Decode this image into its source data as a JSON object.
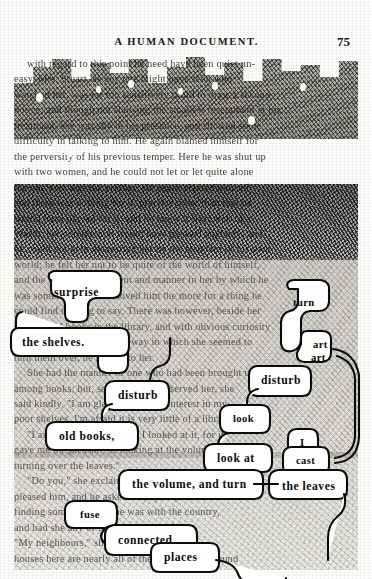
{
  "page": {
    "running_head": "A HUMAN DOCUMENT.",
    "folio": "75",
    "artwork_style": "treated-page",
    "colors": {
      "paper": "#fdfdfc",
      "ink": "#171715",
      "river": "#ffffff",
      "river_outline": "#0c0c0b",
      "wash_dark": "#1e1b17",
      "wash_mid": "#8a8377"
    }
  },
  "river_words": [
    {
      "id": "surprise",
      "text": "surprise",
      "x": 54,
      "y": 286
    },
    {
      "id": "turn",
      "text": "turn",
      "x": 293,
      "y": 297
    },
    {
      "id": "the-shelves",
      "text": "the shelves.",
      "x": 22,
      "y": 336
    },
    {
      "id": "art-upper",
      "text": "art",
      "x": 313,
      "y": 339
    },
    {
      "id": "art-lower",
      "text": "art",
      "x": 311,
      "y": 352
    },
    {
      "id": "disturb-right",
      "text": "disturb",
      "x": 261,
      "y": 374
    },
    {
      "id": "disturb-left",
      "text": "disturb",
      "x": 118,
      "y": 389
    },
    {
      "id": "look",
      "text": "look",
      "x": 233,
      "y": 413
    },
    {
      "id": "old-books",
      "text": "old books,",
      "x": 59,
      "y": 430
    },
    {
      "id": "look-at",
      "text": "look at",
      "x": 217,
      "y": 452
    },
    {
      "id": "i",
      "text": "I",
      "x": 300,
      "y": 437
    },
    {
      "id": "cast",
      "text": "cast",
      "x": 296,
      "y": 455
    },
    {
      "id": "the-volume-and-turn",
      "text": "the volume, and turn",
      "x": 132,
      "y": 478
    },
    {
      "id": "the-leaves",
      "text": "the leaves",
      "x": 282,
      "y": 480
    },
    {
      "id": "fuse",
      "text": "fuse",
      "x": 80,
      "y": 509
    },
    {
      "id": "connected",
      "text": "connected",
      "x": 118,
      "y": 534
    },
    {
      "id": "places",
      "text": "places",
      "x": 164,
      "y": 551
    }
  ],
  "underlying_text": [
    "with regard to this point he need have been quiet un-",
    "easy. Mrs. Stuart, as any one might have seen who",
    "watched her, was far too sensitively timid to draw a second",
    "notice; and though not showing the smallest resentment at his",
    "treatment, she was shy in his presence, and showed some",
    "difficulty in talking to him. He again blamed himself for",
    "the perversity of his previous temper. Here he was shut up",
    "with two women, and he could not let or let quite alone",
    "the one who was the prettier. He again blamed himself,",
    "and there was nothing for it, practice other than that he",
    "would have played for it, and he knew it from that of a",
    "Worth: her complexion would have pleased anybody; and",
    "he could not help measuring her by the standard of his own",
    "world; he felt her not to be quite of the world of himself,",
    "and the signs of refinement and manner in her by which he",
    "was sometimes struck moved him the more for a thing he",
    "could find nothing to say. There was however, beside her",
    "the few old books in the library, and with obvious curiosity",
    "began to examine only the way in which she seemed to",
    "turn them over, he moved to her.",
    "She had the manner of one who had been brought up",
    "among books; but, seeing that he observed her, she",
    "said kindly, \"I am glad you take an interest in my",
    "poor shelves. I'm afraid it is very little of a library.\"",
    "\"I am glad,\" he said, \"that I looked at it, for it",
    "gave me the pleasure of looking at the volume, and",
    "turning over the leaves.\"",
    "\"Do you,\" she exclaimed, \"of interest?\" That",
    "pleased him, and he asked her, by way of",
    "finding some topic, if she was with the country,",
    "and had she any of the places herself.",
    "\"My neighbours,\" she answered, \"and the",
    "houses here are nearly all of them the same. I found"
  ]
}
